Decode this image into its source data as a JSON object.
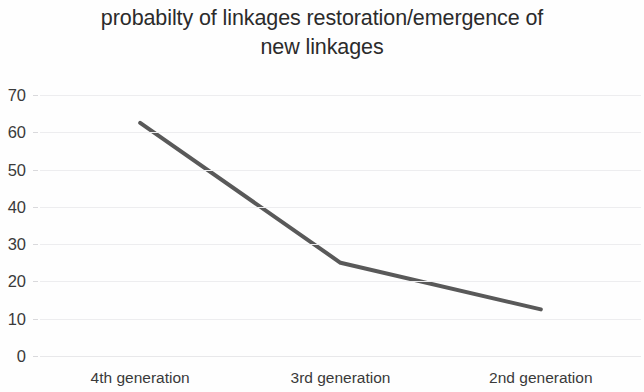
{
  "chart_data": {
    "type": "line",
    "title": "probabilty of linkages restoration/emergence of new linkages",
    "title_line1": "probabilty of linkages restoration/emergence of",
    "title_line2": "new linkages",
    "xlabel": "",
    "ylabel": "",
    "categories": [
      "4th generation",
      "3rd generation",
      "2nd generation"
    ],
    "values": [
      62.5,
      25,
      12.5
    ],
    "series": [
      {
        "name": "probability of linkages restoration/emergence of new linkages",
        "values": [
          62.5,
          25,
          12.5
        ],
        "color": "#595959",
        "line_width": 4,
        "markers": false
      }
    ],
    "ylim": [
      0,
      70
    ],
    "ytick_step": 10,
    "ytick_labels": [
      "70",
      "60",
      "50",
      "40",
      "30",
      "20",
      "10",
      "0"
    ],
    "ytick_values": [
      70,
      60,
      50,
      40,
      30,
      20,
      10,
      0
    ],
    "grid": {
      "horizontal": true,
      "vertical": false,
      "color": "#ededef"
    },
    "legend": {
      "visible": false,
      "position": "none"
    },
    "background_color": "#ffffff",
    "text_color": "#3a3a3a"
  }
}
